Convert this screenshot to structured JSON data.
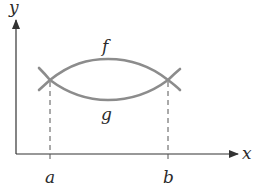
{
  "diagram": {
    "title": "",
    "axes": {
      "x_label": "x",
      "y_label": "y"
    },
    "curves": [
      {
        "name": "f",
        "label": "f",
        "description": "upper curve between a and b"
      },
      {
        "name": "g",
        "label": "g",
        "description": "lower curve between a and b"
      }
    ],
    "markers": {
      "a_label": "a",
      "b_label": "b"
    },
    "colors": {
      "curve": "#8c8c8c",
      "axis": "#333333",
      "dash": "#555555",
      "text": "#2b2b2b"
    }
  }
}
